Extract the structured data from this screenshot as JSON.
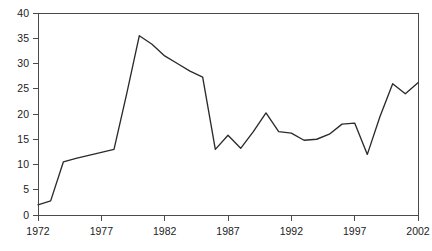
{
  "chart_data": {
    "type": "line",
    "title": "",
    "subtitle": "",
    "xlabel": "",
    "ylabel": "",
    "xlim": [
      1972,
      2002
    ],
    "ylim": [
      0,
      40
    ],
    "grid": false,
    "legend": false,
    "legend_position": "none",
    "line_color": "#2b2b2b",
    "axis_color": "#4a4a4a",
    "background_color": "#ffffff",
    "y_ticks": [
      0,
      5,
      10,
      15,
      20,
      25,
      30,
      35,
      40
    ],
    "y_tick_labels": [
      "0",
      "5",
      "10",
      "15",
      "20",
      "25",
      "30",
      "35",
      "40"
    ],
    "x_ticks": [
      1972,
      1977,
      1982,
      1987,
      1992,
      1997,
      2002
    ],
    "x_tick_labels": [
      "1972",
      "1977",
      "1982",
      "1987",
      "1992",
      "1997",
      "2002"
    ],
    "x": [
      1972,
      1973,
      1974,
      1975,
      1976,
      1977,
      1978,
      1979,
      1980,
      1981,
      1982,
      1983,
      1984,
      1985,
      1986,
      1987,
      1988,
      1989,
      1990,
      1991,
      1992,
      1993,
      1994,
      1995,
      1996,
      1997,
      1998,
      1999,
      2000,
      2001,
      2002
    ],
    "values": [
      2.0,
      2.8,
      10.5,
      11.2,
      11.8,
      12.4,
      13.0,
      24.0,
      35.5,
      33.8,
      31.5,
      30.0,
      28.5,
      27.3,
      13.0,
      15.8,
      13.2,
      16.5,
      20.2,
      16.5,
      16.2,
      14.8,
      15.0,
      16.0,
      18.0,
      18.2,
      12.0,
      19.5,
      26.0,
      24.0,
      26.2
    ]
  }
}
